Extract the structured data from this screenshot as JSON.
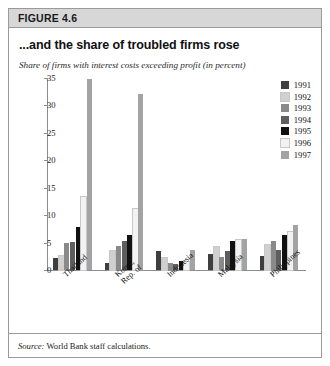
{
  "figure": {
    "header_label": "FIGURE 4.6",
    "title": "...and the share of troubled firms rose",
    "subtitle": "Share of firms with interest costs exceeding profit (in percent)",
    "source_prefix": "Source:",
    "source_text": "World Bank staff calculations."
  },
  "colors": {
    "header_bg": "#d7d7d7",
    "frame_border": "#9a9a9a",
    "axis": "#8d8d8d",
    "series": [
      "#3f3f3f",
      "#d0d0d0",
      "#8a8a8a",
      "#5e5e5e",
      "#111111",
      "#f2f2f2",
      "#a3a3a3"
    ]
  },
  "chart_data": {
    "type": "bar",
    "title": "...and the share of troubled firms rose",
    "xlabel": "",
    "ylabel": "Share of firms with interest costs exceeding profit (in percent)",
    "ylim": [
      0,
      35
    ],
    "yticks": [
      0,
      5,
      10,
      15,
      20,
      25,
      30,
      35
    ],
    "grid": false,
    "legend_position": "top-right",
    "categories": [
      "Thailand",
      "Korea,\nRep. of",
      "Indonesia",
      "Malaysia",
      "Philippines"
    ],
    "series": [
      {
        "name": "1991",
        "values": [
          2.2,
          1.3,
          3.4,
          3.0,
          2.6
        ]
      },
      {
        "name": "1992",
        "values": [
          2.6,
          3.4,
          2.2,
          4.2,
          4.5
        ]
      },
      {
        "name": "1993",
        "values": [
          5.0,
          4.3,
          1.2,
          2.4,
          5.2
        ]
      },
      {
        "name": "1994",
        "values": [
          5.1,
          5.2,
          1.1,
          3.4,
          3.7
        ]
      },
      {
        "name": "1995",
        "values": [
          7.8,
          6.3,
          1.7,
          5.3,
          6.4
        ]
      },
      {
        "name": "1996",
        "values": [
          13.3,
          11.1,
          1.4,
          5.4,
          6.9
        ]
      },
      {
        "name": "1997",
        "values": [
          34.8,
          32.1,
          3.6,
          5.6,
          8.2
        ]
      }
    ]
  }
}
